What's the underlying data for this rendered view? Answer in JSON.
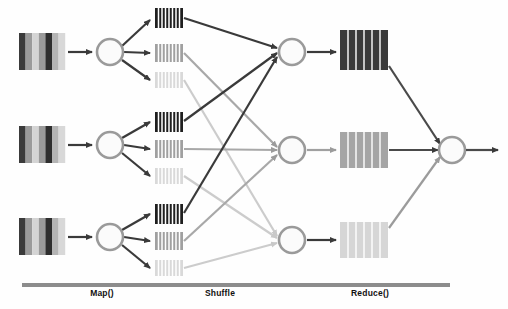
{
  "diagram": {
    "type": "flow-diagram",
    "canvas": {
      "width": 508,
      "height": 309
    },
    "background_color": "#fefefe"
  },
  "palette": {
    "dark": "#2b2b2b",
    "medium": "#8f8f8f",
    "light": "#cfcfcf",
    "very_light": "#e6e6e6",
    "node_stroke": "#9a9a9a",
    "node_fill": "#fbfbfb",
    "arrow_dark": "#3a3a3a",
    "arrow_medium": "#9b9b9b",
    "arrow_light": "#c9c9c9",
    "bar": "#8c8c8c",
    "label_text": "#111111"
  },
  "stages": [
    {
      "id": "map",
      "label": "Map()",
      "bar": {
        "x": 22,
        "y": 283,
        "width": 160,
        "height": 4
      }
    },
    {
      "id": "shuffle",
      "label": "Shuffle",
      "bar": {
        "x": 150,
        "y": 283,
        "width": 140,
        "height": 4
      }
    },
    {
      "id": "reduce",
      "label": "Reduce()",
      "bar": {
        "x": 290,
        "y": 283,
        "width": 160,
        "height": 4
      }
    }
  ],
  "input_blocks": [
    {
      "id": "input-1",
      "x": 19,
      "y": 33,
      "width": 46,
      "height": 37,
      "stripes": [
        "#3a3a3a",
        "#9a9a9a",
        "#d4d4d4",
        "#9a9a9a",
        "#2e2e2e",
        "#b4b4b4",
        "#d8d8d8"
      ]
    },
    {
      "id": "input-2",
      "x": 19,
      "y": 126,
      "width": 46,
      "height": 37,
      "stripes": [
        "#3a3a3a",
        "#9a9a9a",
        "#d4d4d4",
        "#9a9a9a",
        "#2e2e2e",
        "#b4b4b4",
        "#d8d8d8"
      ]
    },
    {
      "id": "input-3",
      "x": 19,
      "y": 218,
      "width": 46,
      "height": 37,
      "stripes": [
        "#3a3a3a",
        "#9a9a9a",
        "#d4d4d4",
        "#9a9a9a",
        "#2e2e2e",
        "#b4b4b4",
        "#d8d8d8"
      ]
    }
  ],
  "mapper_nodes": [
    {
      "id": "mapper-1",
      "cx": 110,
      "cy": 52,
      "r": 14
    },
    {
      "id": "mapper-2",
      "cx": 110,
      "cy": 145,
      "r": 14
    },
    {
      "id": "mapper-3",
      "cx": 110,
      "cy": 237,
      "r": 14
    }
  ],
  "shuffle_blocks": [
    {
      "id": "shuffle-1-dark",
      "group": 1,
      "shade": "dark",
      "color": "#1f1f1f",
      "x": 155,
      "y": 8,
      "width": 28,
      "height": 20,
      "stripes": 7
    },
    {
      "id": "shuffle-1-medium",
      "group": 1,
      "shade": "medium",
      "color": "#a0a0a0",
      "x": 155,
      "y": 44,
      "width": 28,
      "height": 18,
      "stripes": 7
    },
    {
      "id": "shuffle-1-light",
      "group": 1,
      "shade": "light",
      "color": "#d9d9d9",
      "x": 155,
      "y": 72,
      "width": 28,
      "height": 16,
      "stripes": 7
    },
    {
      "id": "shuffle-2-dark",
      "group": 2,
      "shade": "dark",
      "color": "#1f1f1f",
      "x": 155,
      "y": 112,
      "width": 28,
      "height": 20,
      "stripes": 7
    },
    {
      "id": "shuffle-2-medium",
      "group": 2,
      "shade": "medium",
      "color": "#a0a0a0",
      "x": 155,
      "y": 140,
      "width": 28,
      "height": 18,
      "stripes": 7
    },
    {
      "id": "shuffle-2-light",
      "group": 2,
      "shade": "light",
      "color": "#d9d9d9",
      "x": 155,
      "y": 168,
      "width": 28,
      "height": 16,
      "stripes": 7
    },
    {
      "id": "shuffle-3-dark",
      "group": 3,
      "shade": "dark",
      "color": "#1f1f1f",
      "x": 155,
      "y": 204,
      "width": 28,
      "height": 20,
      "stripes": 7
    },
    {
      "id": "shuffle-3-medium",
      "group": 3,
      "shade": "medium",
      "color": "#a0a0a0",
      "x": 155,
      "y": 232,
      "width": 28,
      "height": 18,
      "stripes": 7
    },
    {
      "id": "shuffle-3-light",
      "group": 3,
      "shade": "light",
      "color": "#d9d9d9",
      "x": 155,
      "y": 260,
      "width": 28,
      "height": 16,
      "stripes": 7
    }
  ],
  "reducer_nodes": [
    {
      "id": "reducer-1",
      "cx": 292,
      "cy": 52,
      "r": 14
    },
    {
      "id": "reducer-2",
      "cx": 292,
      "cy": 150,
      "r": 14
    },
    {
      "id": "reducer-3",
      "cx": 292,
      "cy": 240,
      "r": 14
    }
  ],
  "reduce_blocks": [
    {
      "id": "reduce-1",
      "shade": "dark",
      "color": "#3a3a3a",
      "x": 340,
      "y": 30,
      "width": 48,
      "height": 40,
      "stripes": 6
    },
    {
      "id": "reduce-2",
      "shade": "medium",
      "color": "#a5a5a5",
      "x": 340,
      "y": 132,
      "width": 48,
      "height": 36,
      "stripes": 6
    },
    {
      "id": "reduce-3",
      "shade": "light",
      "color": "#d6d6d6",
      "x": 340,
      "y": 222,
      "width": 48,
      "height": 36,
      "stripes": 6
    }
  ],
  "output_node": {
    "id": "output",
    "cx": 452,
    "cy": 150,
    "r": 14
  },
  "output_arrow": {
    "from_x": 466,
    "to_x": 500,
    "y": 150
  },
  "edges": {
    "input_to_mapper": [
      {
        "from": "input-1",
        "to": "mapper-1",
        "shade": "dark"
      },
      {
        "from": "input-2",
        "to": "mapper-2",
        "shade": "dark"
      },
      {
        "from": "input-3",
        "to": "mapper-3",
        "shade": "dark"
      }
    ],
    "mapper_to_shuffle": [
      {
        "from": "mapper-1",
        "to": "shuffle-1-dark"
      },
      {
        "from": "mapper-1",
        "to": "shuffle-1-medium"
      },
      {
        "from": "mapper-1",
        "to": "shuffle-1-light"
      },
      {
        "from": "mapper-2",
        "to": "shuffle-2-dark"
      },
      {
        "from": "mapper-2",
        "to": "shuffle-2-medium"
      },
      {
        "from": "mapper-2",
        "to": "shuffle-2-light"
      },
      {
        "from": "mapper-3",
        "to": "shuffle-3-dark"
      },
      {
        "from": "mapper-3",
        "to": "shuffle-3-medium"
      },
      {
        "from": "mapper-3",
        "to": "shuffle-3-light"
      }
    ],
    "shuffle_to_reducer": [
      {
        "from": "shuffle-1-dark",
        "to": "reducer-1",
        "shade": "dark"
      },
      {
        "from": "shuffle-2-dark",
        "to": "reducer-1",
        "shade": "dark"
      },
      {
        "from": "shuffle-3-dark",
        "to": "reducer-1",
        "shade": "dark"
      },
      {
        "from": "shuffle-1-medium",
        "to": "reducer-2",
        "shade": "medium"
      },
      {
        "from": "shuffle-2-medium",
        "to": "reducer-2",
        "shade": "medium"
      },
      {
        "from": "shuffle-3-medium",
        "to": "reducer-2",
        "shade": "medium"
      },
      {
        "from": "shuffle-1-light",
        "to": "reducer-3",
        "shade": "light"
      },
      {
        "from": "shuffle-2-light",
        "to": "reducer-3",
        "shade": "light"
      },
      {
        "from": "shuffle-3-light",
        "to": "reducer-3",
        "shade": "light"
      }
    ],
    "reducer_to_block": [
      {
        "from": "reducer-1",
        "to": "reduce-1",
        "shade": "dark"
      },
      {
        "from": "reducer-2",
        "to": "reduce-2",
        "shade": "medium"
      },
      {
        "from": "reducer-3",
        "to": "reduce-3",
        "shade": "light"
      }
    ],
    "block_to_output": [
      {
        "from": "reduce-1",
        "to": "output",
        "shade": "dark"
      },
      {
        "from": "reduce-2",
        "to": "output",
        "shade": "dark"
      },
      {
        "from": "reduce-3",
        "to": "output",
        "shade": "dark"
      }
    ]
  }
}
